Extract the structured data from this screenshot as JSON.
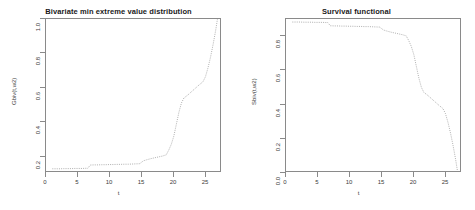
{
  "figure": {
    "background": "#ffffff",
    "line_color": "#9a9a9a",
    "axis_color": "#8a8a8a"
  },
  "chart_data": [
    {
      "type": "line",
      "panel": "left",
      "title": "Bivariate min extreme value distribution",
      "xlabel": "t",
      "ylabel": "Gbiv(t,w2)",
      "xlim": [
        0,
        27.5
      ],
      "ylim": [
        0.105,
        1.0
      ],
      "grid": false,
      "legend": "none",
      "linestyle": "dotted",
      "xticks": [
        0,
        5,
        10,
        15,
        20,
        25
      ],
      "yticks": [
        0.2,
        0.4,
        0.6,
        0.8,
        1.0
      ],
      "x": [
        1.0,
        1.6,
        2.2,
        2.8,
        3.4,
        4.0,
        4.6,
        5.2,
        5.8,
        6.2,
        6.6,
        7.0,
        7.6,
        8.2,
        8.8,
        9.4,
        10.0,
        10.6,
        11.2,
        11.8,
        12.4,
        13.0,
        13.6,
        14.2,
        14.8,
        15.4,
        16.0,
        16.6,
        17.2,
        17.8,
        18.4,
        19.0,
        19.4,
        19.8,
        20.2,
        20.6,
        21.0,
        21.4,
        21.8,
        22.4,
        23.0,
        23.6,
        24.2,
        24.8,
        25.2,
        25.6,
        26.0,
        26.4,
        26.8,
        27.1
      ],
      "y": [
        0.118,
        0.118,
        0.118,
        0.119,
        0.119,
        0.119,
        0.12,
        0.12,
        0.12,
        0.121,
        0.121,
        0.14,
        0.141,
        0.141,
        0.142,
        0.142,
        0.143,
        0.143,
        0.144,
        0.144,
        0.145,
        0.145,
        0.146,
        0.147,
        0.148,
        0.165,
        0.172,
        0.178,
        0.183,
        0.188,
        0.193,
        0.2,
        0.228,
        0.262,
        0.31,
        0.38,
        0.45,
        0.505,
        0.535,
        0.552,
        0.572,
        0.592,
        0.612,
        0.63,
        0.66,
        0.712,
        0.775,
        0.848,
        0.93,
        1.0
      ]
    },
    {
      "type": "line",
      "panel": "right",
      "title": "Survival functional",
      "xlabel": "t",
      "ylabel": "Sbiv(t,w2)",
      "xlim": [
        0,
        27.5
      ],
      "ylim": [
        0.0,
        0.9
      ],
      "grid": false,
      "legend": "none",
      "linestyle": "dotted",
      "xticks": [
        0,
        5,
        10,
        15,
        20,
        25
      ],
      "yticks": [
        0.0,
        0.2,
        0.4,
        0.6,
        0.8
      ],
      "x": [
        1.0,
        1.6,
        2.2,
        2.8,
        3.4,
        4.0,
        4.6,
        5.2,
        5.8,
        6.2,
        6.6,
        7.0,
        7.6,
        8.2,
        8.8,
        9.4,
        10.0,
        10.6,
        11.2,
        11.8,
        12.4,
        13.0,
        13.6,
        14.2,
        14.8,
        15.4,
        16.0,
        16.6,
        17.2,
        17.8,
        18.4,
        19.0,
        19.4,
        19.8,
        20.2,
        20.6,
        21.0,
        21.4,
        21.8,
        22.4,
        23.0,
        23.6,
        24.2,
        24.8,
        25.2,
        25.6,
        26.0,
        26.4,
        26.8,
        27.1
      ],
      "y": [
        0.882,
        0.882,
        0.882,
        0.881,
        0.881,
        0.881,
        0.88,
        0.88,
        0.88,
        0.879,
        0.879,
        0.86,
        0.859,
        0.859,
        0.858,
        0.858,
        0.857,
        0.857,
        0.856,
        0.856,
        0.855,
        0.855,
        0.854,
        0.853,
        0.852,
        0.835,
        0.828,
        0.822,
        0.817,
        0.812,
        0.807,
        0.8,
        0.772,
        0.738,
        0.69,
        0.62,
        0.55,
        0.495,
        0.465,
        0.448,
        0.428,
        0.408,
        0.388,
        0.37,
        0.34,
        0.288,
        0.225,
        0.152,
        0.07,
        0.0
      ]
    }
  ]
}
